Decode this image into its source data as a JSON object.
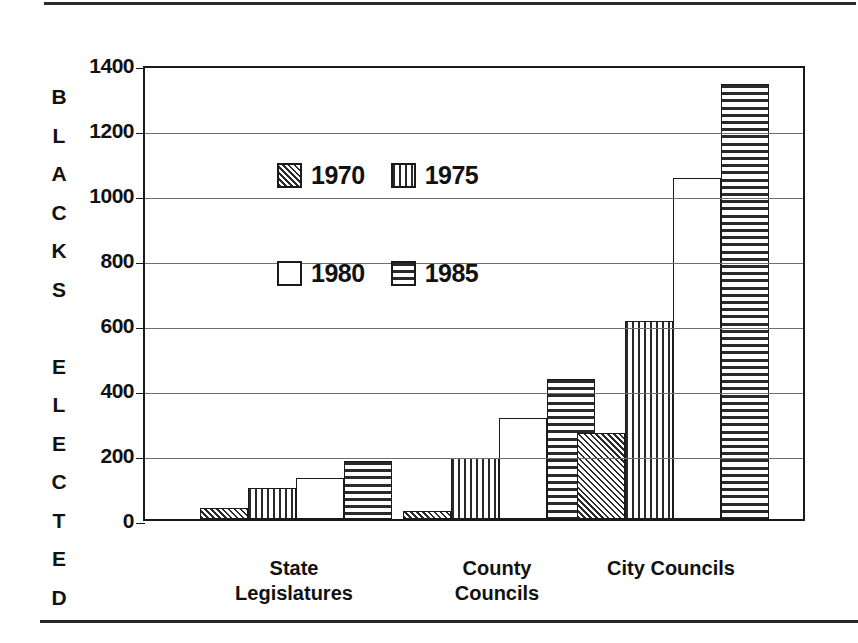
{
  "chart_data": {
    "type": "bar",
    "title": "",
    "xlabel": "",
    "ylabel": "BLACKS ELECTED",
    "ylim": [
      0,
      1400
    ],
    "ytick_interval": 200,
    "yticks": [
      "1400",
      "1200",
      "1000",
      "800",
      "600",
      "400",
      "200",
      "0"
    ],
    "ytick_values": [
      1400,
      1200,
      1000,
      800,
      600,
      400,
      200,
      0
    ],
    "grid": "horizontal",
    "legend_position": "inside-upper-left",
    "categories": [
      "State Legislatures",
      "County Councils",
      "City Councils"
    ],
    "category_label_lines": [
      [
        "State",
        "Legislatures"
      ],
      [
        "County",
        "Councils"
      ],
      [
        "City Councils"
      ]
    ],
    "series": [
      {
        "name": "1970",
        "pattern": "diagonal-hatch",
        "values": [
          35,
          25,
          265
        ]
      },
      {
        "name": "1975",
        "pattern": "vertical-lines",
        "values": [
          95,
          188,
          610
        ]
      },
      {
        "name": "1980",
        "pattern": "solid-white",
        "values": [
          125,
          310,
          1050
        ]
      },
      {
        "name": "1985",
        "pattern": "horizontal-lines",
        "values": [
          180,
          430,
          1340
        ]
      }
    ]
  },
  "axis_caption_letters": [
    "B",
    "L",
    "A",
    "C",
    "K",
    "S",
    "",
    "E",
    "L",
    "E",
    "C",
    "T",
    "E",
    "D"
  ],
  "colors": {
    "axis": "#1a1a1a",
    "gridline": "#6f6f6f",
    "hatch": "#2a2a2a",
    "background": "#ffffff"
  }
}
